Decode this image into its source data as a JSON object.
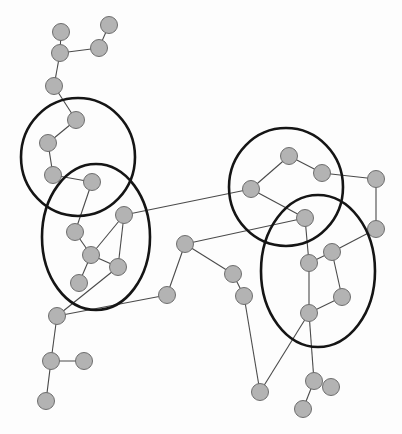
{
  "diagram": {
    "type": "network-graph-with-clusters",
    "node_color": "#b3b3b3",
    "node_stroke": "#6e6e6e",
    "edge_color": "#4a4a4a",
    "cluster_color": "#151515",
    "nodes": [
      {
        "id": "n1",
        "x": 61,
        "y": 32
      },
      {
        "id": "n2",
        "x": 109,
        "y": 25
      },
      {
        "id": "n3",
        "x": 60,
        "y": 53
      },
      {
        "id": "n4",
        "x": 99,
        "y": 48
      },
      {
        "id": "n5",
        "x": 54,
        "y": 86
      },
      {
        "id": "n6",
        "x": 76,
        "y": 120
      },
      {
        "id": "n7",
        "x": 48,
        "y": 143
      },
      {
        "id": "n8",
        "x": 53,
        "y": 175
      },
      {
        "id": "n9",
        "x": 92,
        "y": 182
      },
      {
        "id": "n10",
        "x": 124,
        "y": 215
      },
      {
        "id": "n11",
        "x": 75,
        "y": 232
      },
      {
        "id": "n12",
        "x": 91,
        "y": 255
      },
      {
        "id": "n13",
        "x": 118,
        "y": 267
      },
      {
        "id": "n14",
        "x": 79,
        "y": 283
      },
      {
        "id": "n15",
        "x": 57,
        "y": 316
      },
      {
        "id": "n16",
        "x": 167,
        "y": 295
      },
      {
        "id": "n17",
        "x": 185,
        "y": 244
      },
      {
        "id": "n18",
        "x": 51,
        "y": 361
      },
      {
        "id": "n19",
        "x": 84,
        "y": 361
      },
      {
        "id": "n20",
        "x": 46,
        "y": 401
      },
      {
        "id": "n21",
        "x": 233,
        "y": 274
      },
      {
        "id": "n22",
        "x": 244,
        "y": 296
      },
      {
        "id": "n23",
        "x": 260,
        "y": 392
      },
      {
        "id": "n24",
        "x": 289,
        "y": 156
      },
      {
        "id": "n25",
        "x": 322,
        "y": 173
      },
      {
        "id": "n26",
        "x": 376,
        "y": 179
      },
      {
        "id": "n27",
        "x": 251,
        "y": 189
      },
      {
        "id": "n28",
        "x": 305,
        "y": 218
      },
      {
        "id": "n29",
        "x": 376,
        "y": 229
      },
      {
        "id": "n30",
        "x": 332,
        "y": 252
      },
      {
        "id": "n31",
        "x": 309,
        "y": 263
      },
      {
        "id": "n32",
        "x": 342,
        "y": 297
      },
      {
        "id": "n33",
        "x": 309,
        "y": 313
      },
      {
        "id": "n34",
        "x": 314,
        "y": 381
      },
      {
        "id": "n35",
        "x": 331,
        "y": 387
      },
      {
        "id": "n36",
        "x": 303,
        "y": 409
      }
    ],
    "edges": [
      [
        "n1",
        "n3"
      ],
      [
        "n2",
        "n4"
      ],
      [
        "n3",
        "n4"
      ],
      [
        "n3",
        "n5"
      ],
      [
        "n5",
        "n6"
      ],
      [
        "n6",
        "n7"
      ],
      [
        "n7",
        "n8"
      ],
      [
        "n8",
        "n9"
      ],
      [
        "n9",
        "n11"
      ],
      [
        "n10",
        "n12"
      ],
      [
        "n10",
        "n13"
      ],
      [
        "n11",
        "n12"
      ],
      [
        "n12",
        "n13"
      ],
      [
        "n12",
        "n14"
      ],
      [
        "n13",
        "n15"
      ],
      [
        "n10",
        "n27"
      ],
      [
        "n15",
        "n16"
      ],
      [
        "n15",
        "n18"
      ],
      [
        "n16",
        "n17"
      ],
      [
        "n17",
        "n21"
      ],
      [
        "n17",
        "n28"
      ],
      [
        "n21",
        "n22"
      ],
      [
        "n22",
        "n23"
      ],
      [
        "n18",
        "n19"
      ],
      [
        "n18",
        "n20"
      ],
      [
        "n24",
        "n27"
      ],
      [
        "n24",
        "n25"
      ],
      [
        "n25",
        "n26"
      ],
      [
        "n26",
        "n29"
      ],
      [
        "n27",
        "n28"
      ],
      [
        "n28",
        "n31"
      ],
      [
        "n29",
        "n30"
      ],
      [
        "n30",
        "n31"
      ],
      [
        "n30",
        "n32"
      ],
      [
        "n31",
        "n33"
      ],
      [
        "n32",
        "n33"
      ],
      [
        "n33",
        "n23"
      ],
      [
        "n33",
        "n34"
      ],
      [
        "n34",
        "n36"
      ]
    ],
    "clusters": [
      {
        "id": "cluster-1",
        "shape": "circle",
        "cx": 78,
        "cy": 157,
        "rx": 57,
        "ry": 59
      },
      {
        "id": "cluster-2",
        "shape": "ellipse",
        "cx": 96,
        "cy": 237,
        "rx": 54,
        "ry": 73
      },
      {
        "id": "cluster-3",
        "shape": "circle",
        "cx": 286,
        "cy": 187,
        "rx": 57,
        "ry": 59
      },
      {
        "id": "cluster-4",
        "shape": "ellipse",
        "cx": 318,
        "cy": 271,
        "rx": 57,
        "ry": 76
      }
    ]
  }
}
